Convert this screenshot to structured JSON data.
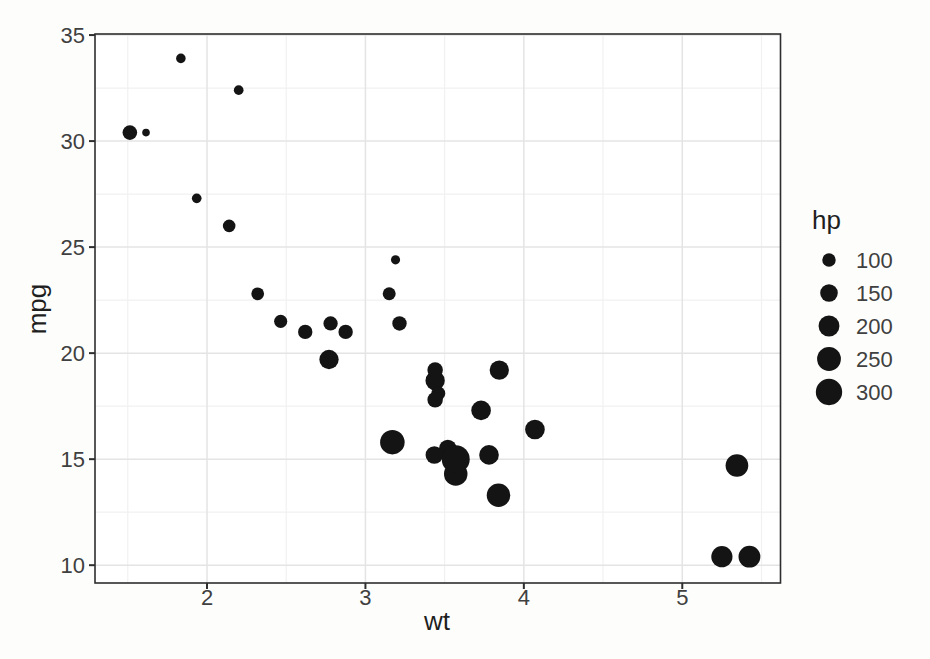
{
  "chart_data": {
    "type": "scatter",
    "title": "",
    "xlabel": "wt",
    "ylabel": "mpg",
    "x_ticks": [
      2,
      3,
      4,
      5
    ],
    "y_ticks": [
      10,
      15,
      20,
      25,
      30,
      35
    ],
    "x_minor": [
      1.5,
      2.5,
      3.5,
      4.5,
      5.5
    ],
    "y_minor": [
      12.5,
      17.5,
      22.5,
      27.5,
      32.5
    ],
    "xlim": [
      1.293,
      5.62
    ],
    "ylim": [
      9.16,
      35.05
    ],
    "grid": "on",
    "legend": {
      "title": "hp",
      "position": "right",
      "sizes": [
        100,
        150,
        200,
        250,
        300
      ]
    },
    "size_domain": [
      52,
      335
    ],
    "points": [
      {
        "wt": 2.62,
        "mpg": 21.0,
        "hp": 110
      },
      {
        "wt": 2.875,
        "mpg": 21.0,
        "hp": 110
      },
      {
        "wt": 2.32,
        "mpg": 22.8,
        "hp": 93
      },
      {
        "wt": 3.215,
        "mpg": 21.4,
        "hp": 110
      },
      {
        "wt": 3.44,
        "mpg": 18.7,
        "hp": 175
      },
      {
        "wt": 3.46,
        "mpg": 18.1,
        "hp": 105
      },
      {
        "wt": 3.57,
        "mpg": 14.3,
        "hp": 245
      },
      {
        "wt": 3.19,
        "mpg": 24.4,
        "hp": 62
      },
      {
        "wt": 3.15,
        "mpg": 22.8,
        "hp": 95
      },
      {
        "wt": 3.44,
        "mpg": 19.2,
        "hp": 123
      },
      {
        "wt": 3.44,
        "mpg": 17.8,
        "hp": 123
      },
      {
        "wt": 4.07,
        "mpg": 16.4,
        "hp": 180
      },
      {
        "wt": 3.73,
        "mpg": 17.3,
        "hp": 180
      },
      {
        "wt": 3.78,
        "mpg": 15.2,
        "hp": 180
      },
      {
        "wt": 5.25,
        "mpg": 10.4,
        "hp": 205
      },
      {
        "wt": 5.424,
        "mpg": 10.4,
        "hp": 215
      },
      {
        "wt": 5.345,
        "mpg": 14.7,
        "hp": 230
      },
      {
        "wt": 2.2,
        "mpg": 32.4,
        "hp": 66
      },
      {
        "wt": 1.615,
        "mpg": 30.4,
        "hp": 52
      },
      {
        "wt": 1.835,
        "mpg": 33.9,
        "hp": 65
      },
      {
        "wt": 2.465,
        "mpg": 21.5,
        "hp": 97
      },
      {
        "wt": 3.52,
        "mpg": 15.5,
        "hp": 150
      },
      {
        "wt": 3.435,
        "mpg": 15.2,
        "hp": 150
      },
      {
        "wt": 3.84,
        "mpg": 13.3,
        "hp": 245
      },
      {
        "wt": 3.845,
        "mpg": 19.2,
        "hp": 175
      },
      {
        "wt": 1.935,
        "mpg": 27.3,
        "hp": 66
      },
      {
        "wt": 2.14,
        "mpg": 26.0,
        "hp": 91
      },
      {
        "wt": 1.513,
        "mpg": 30.4,
        "hp": 113
      },
      {
        "wt": 3.17,
        "mpg": 15.8,
        "hp": 264
      },
      {
        "wt": 2.77,
        "mpg": 19.7,
        "hp": 175
      },
      {
        "wt": 3.57,
        "mpg": 15.0,
        "hp": 335
      },
      {
        "wt": 2.78,
        "mpg": 21.4,
        "hp": 109
      }
    ]
  },
  "colors": {
    "point": "#141414",
    "panel_bg": "#ffffff",
    "grid_major": "#e4e4e4",
    "grid_minor": "#f1f1f1",
    "panel_border": "#2e2e2e",
    "tick_mark": "#2e2e2e",
    "tick_label": "#404040",
    "title_text": "#1f1f1f"
  }
}
